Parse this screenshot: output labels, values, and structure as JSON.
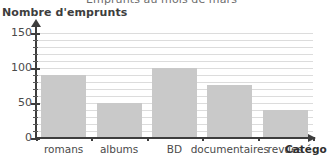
{
  "chart_data": {
    "type": "bar",
    "title": "Emprunts au mois de mars",
    "xlabel": "Catégories",
    "xlabel_visible": "Catégo",
    "ylabel": "Nombre d'emprunts",
    "categories": [
      "romans",
      "albums",
      "BD",
      "documentaires",
      "revues"
    ],
    "values": [
      90,
      50,
      100,
      75,
      40
    ],
    "ylim": [
      0,
      155
    ],
    "ytick_labels": [
      "0",
      "50",
      "100",
      "150"
    ],
    "ytick_values": [
      0,
      50,
      100,
      150
    ],
    "minor_tick_step": 10,
    "grid": true,
    "grid_step": 10,
    "legend": "none",
    "bar_color": "#c9c9c9",
    "grid_color": "#dcdcdc",
    "axis_color": "#3d3d3d",
    "title_color": "#6d6d6d"
  }
}
